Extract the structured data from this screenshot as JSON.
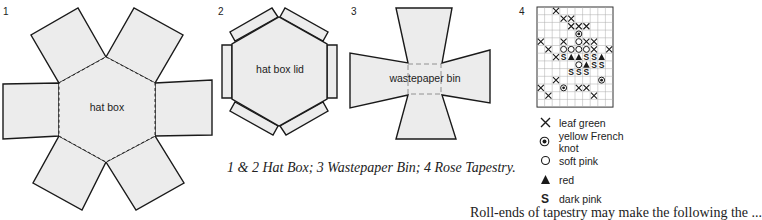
{
  "figures": [
    {
      "number": "1",
      "label": "hat box"
    },
    {
      "number": "2",
      "label": "hat box lid"
    },
    {
      "number": "3",
      "label": "wastepaper bin"
    },
    {
      "number": "4",
      "label": "rose tapestry chart"
    }
  ],
  "caption": "1 & 2 Hat Box; 3 Wastepaper Bin; 4 Rose Tapestry.",
  "body_text_fragment": "Roll-ends of tapestry may make the following the ...",
  "legend": [
    {
      "symbol": "cross",
      "glyph": "✕",
      "label": "leaf green"
    },
    {
      "symbol": "dot-circle",
      "glyph": "◉",
      "label": "yellow French knot"
    },
    {
      "symbol": "circle",
      "glyph": "○",
      "label": "soft pink"
    },
    {
      "symbol": "triangle",
      "glyph": "▲",
      "label": "red"
    },
    {
      "symbol": "s",
      "glyph": "S",
      "label": "dark pink"
    }
  ],
  "colors": {
    "fill": "#ececec",
    "stroke": "#1a1a1a",
    "grid": "#9a9a9a"
  }
}
